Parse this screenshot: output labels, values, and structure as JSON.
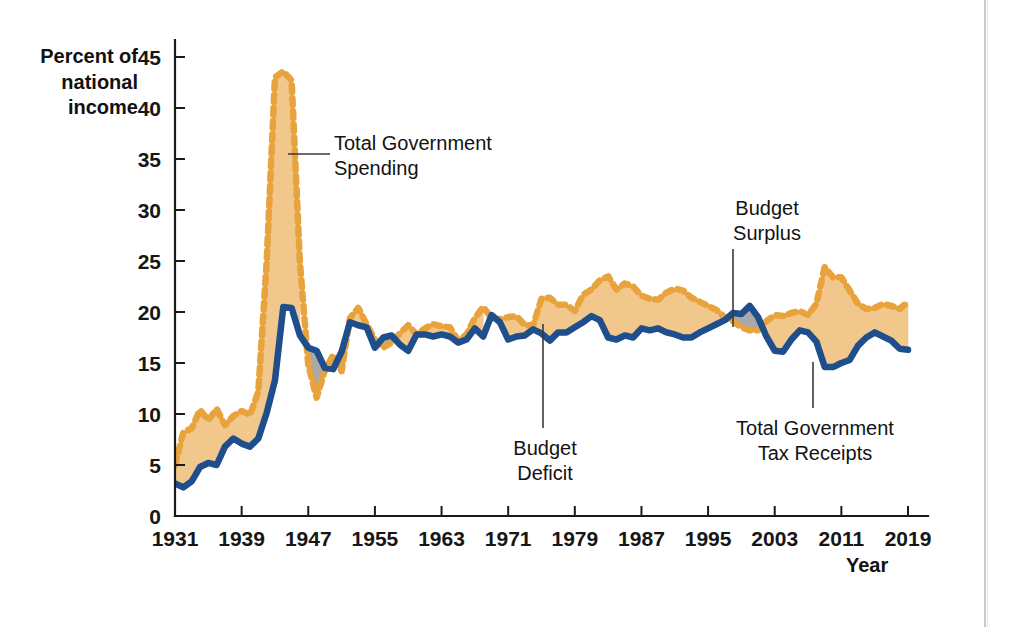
{
  "chart_data": {
    "type": "area",
    "title": "",
    "xlabel": "Year",
    "ylabel": "Percent of national income",
    "xlim": [
      1931,
      2019
    ],
    "ylim": [
      0,
      45
    ],
    "grid": false,
    "legend_position": "annotations",
    "xticks": [
      "1931",
      "1939",
      "1947",
      "1955",
      "1963",
      "1971",
      "1979",
      "1987",
      "1995",
      "2003",
      "2011",
      "2019"
    ],
    "yticks": [
      "0",
      "5",
      "10",
      "15",
      "20",
      "25",
      "30",
      "35",
      "40",
      "45"
    ],
    "x": [
      1931,
      1932,
      1933,
      1934,
      1935,
      1936,
      1937,
      1938,
      1939,
      1940,
      1941,
      1942,
      1943,
      1944,
      1945,
      1946,
      1947,
      1948,
      1949,
      1950,
      1951,
      1952,
      1953,
      1954,
      1955,
      1956,
      1957,
      1958,
      1959,
      1960,
      1961,
      1962,
      1963,
      1964,
      1965,
      1966,
      1967,
      1968,
      1969,
      1970,
      1971,
      1972,
      1973,
      1974,
      1975,
      1976,
      1977,
      1978,
      1979,
      1980,
      1981,
      1982,
      1983,
      1984,
      1985,
      1986,
      1987,
      1988,
      1989,
      1990,
      1991,
      1992,
      1993,
      1994,
      1995,
      1996,
      1997,
      1998,
      1999,
      2000,
      2001,
      2002,
      2003,
      2004,
      2005,
      2006,
      2007,
      2008,
      2009,
      2010,
      2011,
      2012,
      2013,
      2014,
      2015,
      2016,
      2017,
      2018,
      2019
    ],
    "series": [
      {
        "name": "Total Government Spending",
        "style": "dashed-orange",
        "color": "#E8A33D",
        "values": [
          5.0,
          8.2,
          8.6,
          10.4,
          9.4,
          10.5,
          8.9,
          9.8,
          10.3,
          9.9,
          12.2,
          24.8,
          43.0,
          43.6,
          42.7,
          24.8,
          14.8,
          11.6,
          14.3,
          15.8,
          14.2,
          19.4,
          20.4,
          18.8,
          17.3,
          16.5,
          17.0,
          17.9,
          18.7,
          17.8,
          18.4,
          18.8,
          18.6,
          18.5,
          17.2,
          17.8,
          19.4,
          20.5,
          19.4,
          19.3,
          19.5,
          19.6,
          18.7,
          18.7,
          21.3,
          21.4,
          20.7,
          20.7,
          20.1,
          21.7,
          22.2,
          23.1,
          23.5,
          22.2,
          22.8,
          22.5,
          21.6,
          21.3,
          21.2,
          21.9,
          22.3,
          22.1,
          21.4,
          21.0,
          20.6,
          20.2,
          19.5,
          19.1,
          18.5,
          18.2,
          18.2,
          19.1,
          19.7,
          19.6,
          19.9,
          20.1,
          19.7,
          20.8,
          24.4,
          23.4,
          23.4,
          22.1,
          20.8,
          20.3,
          20.4,
          20.8,
          20.6,
          20.3,
          21.0
        ]
      },
      {
        "name": "Total Government Tax Receipts",
        "style": "solid-blue",
        "color": "#1F4E8C",
        "values": [
          3.2,
          2.8,
          3.4,
          4.8,
          5.2,
          5.0,
          6.8,
          7.6,
          7.1,
          6.8,
          7.6,
          10.1,
          13.3,
          20.5,
          20.4,
          17.7,
          16.5,
          16.2,
          14.5,
          14.4,
          16.1,
          19.0,
          18.7,
          18.5,
          16.5,
          17.5,
          17.7,
          16.8,
          16.2,
          17.8,
          17.8,
          17.6,
          17.8,
          17.6,
          17.0,
          17.3,
          18.4,
          17.6,
          19.7,
          19.0,
          17.3,
          17.6,
          17.7,
          18.3,
          17.9,
          17.2,
          18.0,
          18.0,
          18.5,
          19.0,
          19.6,
          19.2,
          17.5,
          17.3,
          17.7,
          17.5,
          18.4,
          18.2,
          18.4,
          18.0,
          17.8,
          17.5,
          17.5,
          18.0,
          18.4,
          18.8,
          19.2,
          19.9,
          19.8,
          20.6,
          19.5,
          17.6,
          16.2,
          16.1,
          17.3,
          18.2,
          18.0,
          17.1,
          14.6,
          14.6,
          15.0,
          15.3,
          16.7,
          17.5,
          18.0,
          17.6,
          17.2,
          16.4,
          16.3
        ]
      }
    ],
    "fill_regions": [
      {
        "name": "budget-deficit-fill",
        "color": "#F2C78C",
        "description": "area between spending (above) and tax receipts (below)"
      },
      {
        "name": "budget-surplus-fill",
        "color": "#A9A9A9",
        "description": "area where tax receipts exceed spending"
      }
    ],
    "annotations": [
      {
        "id": "spending",
        "label": "Total Government\nSpending",
        "target_year": 1944,
        "leader": true
      },
      {
        "id": "surplus",
        "label": "Budget\nSurplus",
        "target_year": 2000,
        "leader": true
      },
      {
        "id": "deficit",
        "label": "Budget\nDeficit",
        "target_year": 1977,
        "leader": true
      },
      {
        "id": "receipts",
        "label": "Total Government\nTax Receipts",
        "target_year": 2009,
        "leader": true
      }
    ]
  },
  "axes": {
    "y_title": "Percent of\nnational\nincome",
    "x_title": "Year"
  },
  "colors": {
    "spending_line": "#E8A33D",
    "receipts_line": "#1F4E8C",
    "deficit_fill": "#F2C78C",
    "surplus_fill": "#A9A9A9",
    "axis": "#1a1a1a",
    "background": "#ffffff"
  }
}
